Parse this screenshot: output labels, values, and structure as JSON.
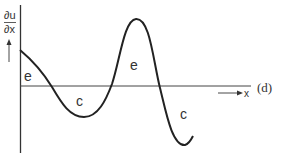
{
  "figure": {
    "y_axis_label_numerator": "∂u",
    "y_axis_label_denominator": "∂x",
    "x_axis_label": "x",
    "panel_label": "(d)",
    "regions": [
      {
        "label": "e",
        "x": 29,
        "y": 80
      },
      {
        "label": "c",
        "x": 80,
        "y": 105
      },
      {
        "label": "e",
        "x": 134,
        "y": 70
      },
      {
        "label": "c",
        "x": 181,
        "y": 117
      }
    ]
  },
  "colors": {
    "line": "#333333",
    "background": "#ffffff"
  }
}
